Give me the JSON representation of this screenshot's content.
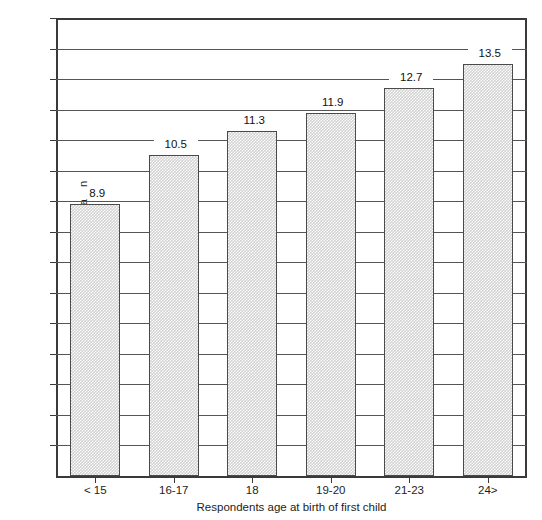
{
  "chart_data": {
    "type": "bar",
    "title": "",
    "subtitle": "",
    "xlabel": "Respondents age at birth of first child",
    "ylabel": "Average years of education",
    "categories": [
      "< 15",
      "16-17",
      "18",
      "19-20",
      "21-23",
      "24>"
    ],
    "values": [
      8.9,
      10.5,
      11.3,
      11.9,
      12.7,
      13.5
    ],
    "value_labels": [
      "8.9",
      "10.5",
      "11.3",
      "11.9",
      "12.7",
      "13.5"
    ],
    "ylim": [
      0,
      15
    ],
    "y_ticks": [
      1,
      2,
      3,
      4,
      5,
      6,
      7,
      8,
      9,
      10,
      11,
      12,
      13,
      14,
      15
    ],
    "y_tick_labels": [
      "1",
      "2",
      "3",
      "4",
      "5",
      "6",
      "7",
      "8",
      "9",
      "10",
      "11",
      "12",
      "13",
      "14",
      "15"
    ],
    "grid": true,
    "legend": "none",
    "series": [
      {
        "name": "Average years of education",
        "values": [
          8.9,
          10.5,
          11.3,
          11.9,
          12.7,
          13.5
        ]
      }
    ],
    "colors": {
      "bar_fill": "#d2d2d2",
      "bar_edge": "#4a4a4a",
      "gridline": "#555555",
      "axis": "#3a3a3a",
      "text": "#1d1d1d",
      "background": "#ffffff"
    }
  }
}
